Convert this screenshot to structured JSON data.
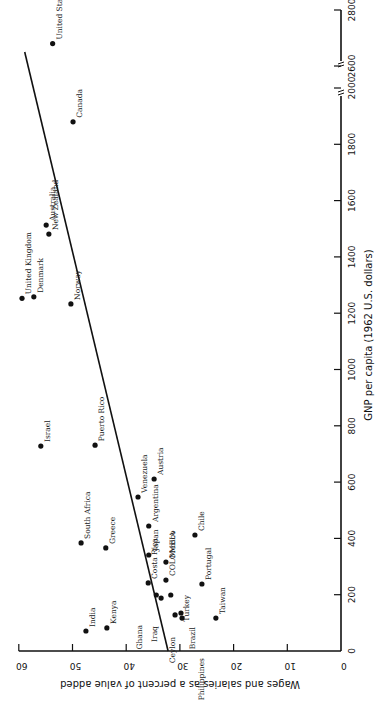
{
  "chart_data": {
    "type": "scatter",
    "title": "",
    "xlabel": "GNP per capita (1962 U.S. dollars)",
    "ylabel": "Wages and salaries as a percent of value added",
    "xlim": [
      0,
      2800
    ],
    "ylim": [
      0,
      60
    ],
    "x_axis_break": {
      "from": 2000,
      "to": 2600
    },
    "x_ticks": [
      0,
      200,
      400,
      600,
      800,
      1000,
      1200,
      1400,
      1600,
      1800,
      2000,
      2600,
      2800
    ],
    "y_ticks": [
      0,
      10,
      20,
      30,
      40,
      50,
      60
    ],
    "grid": false,
    "legend": null,
    "orientation": "rotated 90 degrees clockwise (GNP axis vertical on right, wage axis horizontal at bottom, reversed)",
    "points": [
      {
        "label": "United States",
        "gnp": 2680,
        "wage": 53.7
      },
      {
        "label": "Canada",
        "gnp": 1880,
        "wage": 49.9
      },
      {
        "label": "Australia",
        "gnp": 1513,
        "wage": 54.9
      },
      {
        "label": "New Zealand",
        "gnp": 1481,
        "wage": 54.4
      },
      {
        "label": "United Kingdom",
        "gnp": 1253,
        "wage": 59.4
      },
      {
        "label": "Denmark",
        "gnp": 1258,
        "wage": 57.2
      },
      {
        "label": "Norway",
        "gnp": 1233,
        "wage": 50.3
      },
      {
        "label": "Israel",
        "gnp": 728,
        "wage": 55.9
      },
      {
        "label": "Puerto Rico",
        "gnp": 731,
        "wage": 45.8
      },
      {
        "label": "Austria",
        "gnp": 611,
        "wage": 34.8
      },
      {
        "label": "Venezuela",
        "gnp": 547,
        "wage": 37.8
      },
      {
        "label": "Argentina",
        "gnp": 444,
        "wage": 35.8
      },
      {
        "label": "Chile",
        "gnp": 412,
        "wage": 27.2
      },
      {
        "label": "South Africa",
        "gnp": 384,
        "wage": 48.4
      },
      {
        "label": "Greece",
        "gnp": 366,
        "wage": 43.8
      },
      {
        "label": "Japan",
        "gnp": 341,
        "wage": 35.8
      },
      {
        "label": "Mexico",
        "gnp": 316,
        "wage": 32.6
      },
      {
        "label": "COLOMBIA",
        "gnp": 252,
        "wage": 32.6
      },
      {
        "label": "Costa Rica",
        "gnp": 242,
        "wage": 35.9
      },
      {
        "label": "Portugal",
        "gnp": 238,
        "wage": 25.9
      },
      {
        "label": "Ghana",
        "gnp": 199,
        "wage": 34.4
      },
      {
        "label": "Iraq",
        "gnp": 188,
        "wage": 33.5
      },
      {
        "label": "Turkey",
        "gnp": 199,
        "wage": 31.7
      },
      {
        "label": "Brazil",
        "gnp": 135,
        "wage": 29.8
      },
      {
        "label": "Ceylon",
        "gnp": 128,
        "wage": 30.9
      },
      {
        "label": "Philippines",
        "gnp": 117,
        "wage": 29.6
      },
      {
        "label": "Taiwan",
        "gnp": 117,
        "wage": 23.3
      },
      {
        "label": "Kenya",
        "gnp": 82,
        "wage": 43.6
      },
      {
        "label": "India",
        "gnp": 71,
        "wage": 47.5
      }
    ],
    "regression_line": {
      "start": {
        "gnp": 0,
        "wage": 32.2
      },
      "end": {
        "gnp": 2650,
        "wage": 58.9
      }
    }
  },
  "axes": {
    "gnp_title": "GNP per capita (1962 U.S. dollars)",
    "wage_title": "Wages and salaries as a percent of value added",
    "gnp_ticks": [
      "0",
      "200",
      "400",
      "600",
      "800",
      "1000",
      "1200",
      "1400",
      "1600",
      "1800",
      "2000",
      "2600",
      "2800"
    ],
    "wage_ticks": [
      "60",
      "50",
      "40",
      "30",
      "20",
      "10",
      "0"
    ]
  }
}
